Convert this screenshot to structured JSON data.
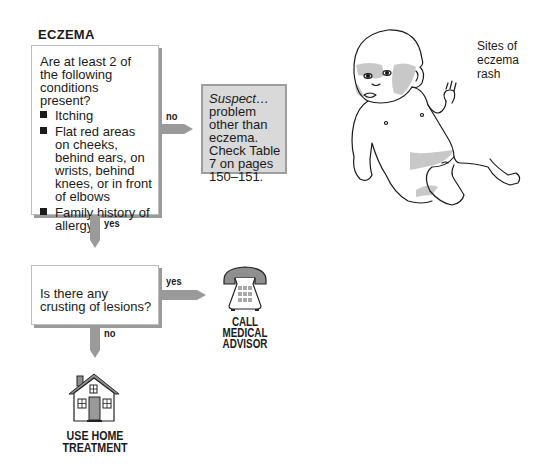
{
  "title": "ECZEMA",
  "question1": {
    "text": "Are at least 2 of the following conditions present?",
    "conditions": [
      "Itching",
      "Flat red areas on cheeks, behind ears, on wrists, behind knees, or in front of elbows",
      "Family history of allergy"
    ]
  },
  "branch1_no": "no",
  "branch1_yes": "yes",
  "suspect": {
    "italic": "Suspect…",
    "text": "problem other than eczema. Check Table 7 on pages 150–151."
  },
  "question2": {
    "text": "Is there any crusting of lesions?"
  },
  "branch2_yes": "yes",
  "branch2_no": "no",
  "outcome_call": {
    "icon": "telephone-icon",
    "label_lines": [
      "CALL",
      "MEDICAL",
      "ADVISOR"
    ]
  },
  "outcome_home": {
    "icon": "house-icon",
    "label_lines": [
      "USE HOME",
      "TREATMENT"
    ]
  },
  "illustration": {
    "subject": "baby-illustration",
    "caption_lines": [
      "Sites of",
      "eczema",
      "rash"
    ]
  },
  "colors": {
    "arrow": "#9a9a9a",
    "rash": "#c8c8c8",
    "suspect_bg": "#d9d9d9"
  }
}
